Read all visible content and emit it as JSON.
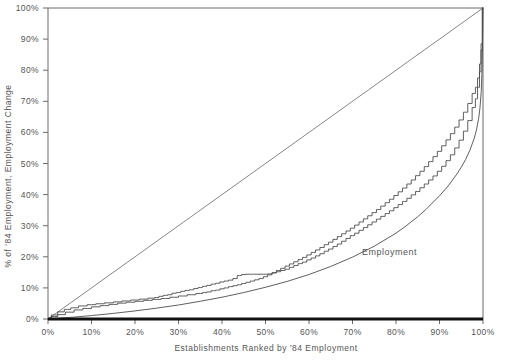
{
  "chart_data": {
    "type": "line",
    "title": "",
    "xlabel": "Establishments Ranked by '84 Employment",
    "ylabel": "% of '84 Employment, Employment Change",
    "xlim": [
      0,
      100
    ],
    "ylim": [
      0,
      100
    ],
    "grid": false,
    "legend_position": "inline-annotation",
    "xticklabels": [
      "0%",
      "10%",
      "20%",
      "30%",
      "40%",
      "50%",
      "60%",
      "70%",
      "80%",
      "90%",
      "100%"
    ],
    "yticklabels": [
      "0%",
      "10%",
      "20%",
      "30%",
      "40%",
      "50%",
      "60%",
      "70%",
      "80%",
      "90%",
      "100%"
    ],
    "xticks": [
      0,
      10,
      20,
      30,
      40,
      50,
      60,
      70,
      80,
      90,
      100
    ],
    "yticks": [
      0,
      10,
      20,
      30,
      40,
      50,
      60,
      70,
      80,
      90,
      100
    ],
    "annotations": [
      {
        "text": "Employment",
        "x": 78.5,
        "y": 20.5
      }
    ],
    "series": [
      {
        "name": "equality-diagonal",
        "style": "straight",
        "color": "#787878",
        "x": [
          0,
          100
        ],
        "y": [
          0,
          100
        ]
      },
      {
        "name": "Employment",
        "style": "smooth",
        "color": "#4d4d4d",
        "x": [
          0,
          5,
          10,
          15,
          20,
          25,
          30,
          35,
          40,
          45,
          50,
          55,
          60,
          65,
          70,
          75,
          80,
          82,
          85,
          87,
          90,
          92,
          94,
          95,
          96,
          97,
          98,
          98.5,
          99,
          99.3,
          99.6,
          99.8,
          100
        ],
        "y": [
          0,
          0.5,
          1.1,
          1.8,
          2.6,
          3.5,
          4.5,
          5.7,
          7.0,
          8.5,
          10.2,
          12.1,
          14.3,
          16.9,
          19.9,
          23.4,
          27.6,
          29.6,
          32.9,
          35.4,
          39.6,
          42.8,
          46.6,
          48.8,
          51.3,
          54.3,
          58.2,
          60.8,
          64.5,
          67.8,
          73.2,
          81.0,
          100
        ]
      },
      {
        "name": "employment-change-a",
        "style": "stepped",
        "color": "#4d4d4d",
        "x": [
          0,
          1.5,
          3,
          4.5,
          6,
          8,
          10,
          12,
          14,
          16,
          18,
          20,
          22,
          24,
          25,
          26,
          27,
          28,
          29,
          30,
          31,
          32,
          33,
          34,
          35,
          36,
          37,
          38,
          39,
          40,
          41,
          42,
          43,
          44,
          45,
          46,
          47,
          48,
          49,
          50,
          51,
          52,
          53,
          54,
          55,
          56,
          57,
          58,
          59,
          60,
          61,
          62,
          63,
          64,
          65,
          66,
          67,
          68,
          69,
          70,
          71,
          72,
          73,
          74,
          75,
          76,
          77,
          78,
          79,
          80,
          81,
          82,
          83,
          84,
          85,
          86,
          87,
          88,
          89,
          90,
          91,
          92,
          93,
          94,
          95,
          96,
          97,
          98,
          98.5,
          99,
          99.4,
          99.7,
          100
        ],
        "y": [
          0,
          1.3,
          2.3,
          3.1,
          3.6,
          4.2,
          4.6,
          4.9,
          5.2,
          5.5,
          5.8,
          6.1,
          6.4,
          6.7,
          6.9,
          7.3,
          7.6,
          7.8,
          8.3,
          8.5,
          8.9,
          9.2,
          9.4,
          9.8,
          10.1,
          10.5,
          10.8,
          11.2,
          11.5,
          11.9,
          12.2,
          12.5,
          13.0,
          14.0,
          14.3,
          14.4,
          14.4,
          14.4,
          14.4,
          14.4,
          14.5,
          14.8,
          15.2,
          15.6,
          16.0,
          16.6,
          17.2,
          17.8,
          18.3,
          19.0,
          19.6,
          20.3,
          21.0,
          21.8,
          22.5,
          23.3,
          24.1,
          25.0,
          25.9,
          26.8,
          27.6,
          28.5,
          29.4,
          30.3,
          31.2,
          32.1,
          33.0,
          33.9,
          34.8,
          35.8,
          36.8,
          37.8,
          38.8,
          39.9,
          41.0,
          42.2,
          43.4,
          44.7,
          46.0,
          47.5,
          49.1,
          50.9,
          52.8,
          55.0,
          57.5,
          60.4,
          63.8,
          68.0,
          70.8,
          74.5,
          79.5,
          86.5,
          100
        ]
      },
      {
        "name": "employment-change-b",
        "style": "stepped",
        "color": "#4d4d4d",
        "x": [
          0,
          1.5,
          3,
          5,
          7,
          9,
          11,
          13,
          15,
          17,
          19,
          21,
          23,
          25,
          27,
          29,
          31,
          33,
          35,
          36,
          37,
          38,
          39,
          40,
          41,
          42,
          43,
          44,
          45,
          46,
          47,
          48,
          49,
          50,
          51,
          52,
          53,
          54,
          55,
          56,
          57,
          58,
          59,
          60,
          61,
          62,
          63,
          64,
          65,
          66,
          67,
          68,
          69,
          70,
          71,
          72,
          73,
          74,
          75,
          76,
          77,
          78,
          79,
          80,
          81,
          82,
          83,
          84,
          85,
          86,
          87,
          88,
          89,
          90,
          91,
          92,
          93,
          94,
          95,
          96,
          97,
          98,
          98.5,
          99,
          99.4,
          99.7,
          100
        ],
        "y": [
          0,
          0.8,
          1.4,
          2.2,
          2.9,
          3.4,
          3.9,
          4.3,
          4.7,
          5.1,
          5.4,
          5.7,
          6.0,
          6.3,
          6.6,
          7.0,
          7.4,
          7.8,
          8.2,
          8.5,
          8.7,
          9.1,
          9.3,
          9.7,
          10.0,
          10.4,
          10.7,
          11.0,
          11.4,
          11.8,
          12.2,
          12.6,
          13.0,
          13.6,
          14.2,
          14.9,
          15.6,
          16.3,
          17.0,
          17.7,
          18.4,
          19.1,
          19.8,
          20.6,
          21.4,
          22.2,
          23.0,
          23.9,
          24.7,
          25.6,
          26.5,
          27.4,
          28.3,
          29.2,
          30.2,
          31.2,
          32.2,
          33.2,
          34.2,
          35.2,
          36.3,
          37.4,
          38.5,
          39.7,
          40.9,
          42.1,
          43.4,
          44.7,
          46.1,
          47.5,
          49.0,
          50.6,
          52.2,
          53.9,
          55.7,
          57.6,
          59.6,
          61.7,
          64.0,
          66.5,
          69.3,
          72.5,
          74.5,
          77.5,
          82.0,
          88.5,
          100
        ]
      },
      {
        "name": "near-zero-baseline",
        "style": "thick-baseline",
        "color": "#111111",
        "x": [
          0,
          20,
          40,
          60,
          80,
          100
        ],
        "y": [
          0,
          0,
          0,
          0,
          0,
          0
        ]
      }
    ]
  }
}
